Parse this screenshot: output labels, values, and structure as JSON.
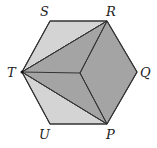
{
  "diagram": {
    "colors": {
      "light": "#d4d4d4",
      "dark": "#a4a4a4",
      "stroke": "#333333",
      "background": "#ffffff"
    },
    "vertices": {
      "S": [
        50,
        21
      ],
      "R": [
        107,
        21
      ],
      "Q": [
        137,
        72
      ],
      "P": [
        107,
        124
      ],
      "U": [
        50,
        124
      ],
      "T": [
        22,
        72
      ]
    },
    "center": [
      80,
      73
    ],
    "labels": [
      {
        "text": "S",
        "x": 40,
        "y": 16
      },
      {
        "text": "R",
        "x": 106,
        "y": 16
      },
      {
        "text": "Q",
        "x": 140,
        "y": 77
      },
      {
        "text": "P",
        "x": 106,
        "y": 139
      },
      {
        "text": "U",
        "x": 39,
        "y": 139
      },
      {
        "text": "T",
        "x": 7,
        "y": 77
      }
    ]
  }
}
